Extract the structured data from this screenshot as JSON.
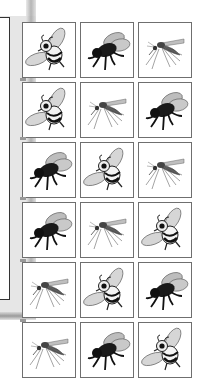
{
  "grid": {
    "rows": 6,
    "columns": 3,
    "tiles": [
      [
        "bee",
        "fly",
        "mosquito"
      ],
      [
        "bee",
        "mosquito",
        "fly"
      ],
      [
        "fly",
        "bee",
        "mosquito"
      ],
      [
        "fly",
        "mosquito",
        "bee"
      ],
      [
        "mosquito",
        "bee",
        "fly"
      ],
      [
        "mosquito",
        "fly",
        "bee"
      ]
    ]
  },
  "icons": {
    "bee": "bee-icon",
    "fly": "fly-icon",
    "mosquito": "mosquito-icon"
  },
  "colors": {
    "tile_border": "#6f6f6f",
    "backdrop": "#e6e6e6",
    "panel_border": "#333333"
  }
}
